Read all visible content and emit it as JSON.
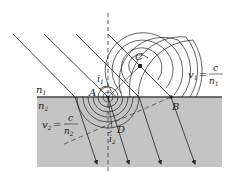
{
  "diagram": {
    "colors": {
      "background": "#ffffff",
      "medium2": "#c4c4c4",
      "interface": "#444444",
      "line": "#222222"
    },
    "labels": {
      "n1": "n",
      "n1_sub": "1",
      "n2": "n",
      "n2_sub": "2",
      "A": "A",
      "B": "B",
      "C": "C",
      "D": "D",
      "i1": "i",
      "i1_sub": "1",
      "i2": "i",
      "i2_sub": "2",
      "v1_lhs": "v",
      "v1_sub": "1",
      "v1_eq": "=",
      "v1_num": "c",
      "v1_den": "n",
      "v1_den_sub": "1",
      "v2_lhs": "v",
      "v2_sub": "2",
      "v2_eq": "=",
      "v2_num": "c",
      "v2_den": "n",
      "v2_den_sub": "2"
    },
    "points": {
      "A": [
        108,
        97
      ],
      "B": [
        171,
        97
      ],
      "C": [
        140,
        66
      ],
      "D": [
        112,
        128
      ]
    }
  }
}
